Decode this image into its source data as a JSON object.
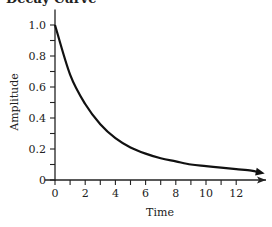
{
  "chart_data": {
    "type": "line",
    "title": "Decay Curve",
    "xlabel": "Time",
    "ylabel": "Amplitude",
    "xlim": [
      0,
      14
    ],
    "ylim": [
      0,
      1.1
    ],
    "x_ticks": [
      "0",
      "2",
      "4",
      "6",
      "8",
      "10",
      "12"
    ],
    "y_ticks": [
      "0",
      "0.2",
      "0.4",
      "0.6",
      "0.8",
      "1.0"
    ],
    "grid": false,
    "legend": null,
    "series": [
      {
        "name": "Amplitude",
        "x": [
          0,
          1,
          2,
          3,
          4,
          5,
          6,
          7,
          8,
          9,
          10,
          11,
          12,
          13,
          13.5
        ],
        "values": [
          1.0,
          0.68,
          0.49,
          0.36,
          0.27,
          0.21,
          0.17,
          0.14,
          0.12,
          0.1,
          0.09,
          0.08,
          0.07,
          0.06,
          0.05
        ],
        "color": "#111111"
      }
    ]
  },
  "colors": {
    "line": "#111111",
    "axis": "#222222"
  }
}
